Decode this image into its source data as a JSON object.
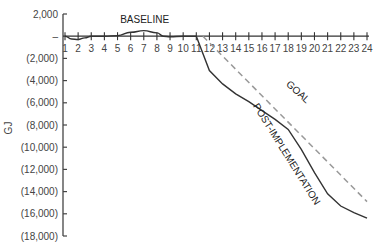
{
  "chart_data": {
    "type": "line",
    "title": "",
    "xlabel": "",
    "ylabel": "GJ",
    "x": [
      1,
      2,
      3,
      4,
      5,
      6,
      7,
      8,
      9,
      10,
      11,
      12,
      13,
      14,
      15,
      16,
      17,
      18,
      19,
      20,
      21,
      22,
      23,
      24
    ],
    "x_tick_labels": [
      "1",
      "2",
      "3",
      "4",
      "5",
      "6",
      "7",
      "8",
      "9",
      "10",
      "11",
      "12",
      "13",
      "14",
      "15",
      "16",
      "17",
      "18",
      "19",
      "20",
      "21",
      "22",
      "23",
      "24"
    ],
    "ylim": [
      -18000,
      2000
    ],
    "y_ticks": [
      2000,
      0,
      -2000,
      -4000,
      -6000,
      -8000,
      -10000,
      -12000,
      -14000,
      -16000,
      -18000
    ],
    "y_tick_labels": [
      "2,000",
      "–",
      "(2,000)",
      "(4,000)",
      "(6,000)",
      "(8,000)",
      "(10,000)",
      "(12,000)",
      "(14,000)",
      "(16,000)",
      "(18,000)"
    ],
    "grid": false,
    "legend": "none (inline annotations)",
    "series": [
      {
        "name": "BASELINE",
        "style": "solid",
        "color": "#333333",
        "x": [
          1,
          1.5,
          2,
          2.5,
          3,
          4,
          5,
          6,
          7,
          8,
          8.5,
          9,
          10,
          11
        ],
        "values": [
          0,
          -250,
          -300,
          -150,
          0,
          0,
          50,
          350,
          500,
          300,
          0,
          -50,
          0,
          0
        ]
      },
      {
        "name": "POST-IMPLEMENTATION",
        "style": "solid",
        "color": "#333333",
        "x": [
          11,
          12,
          13,
          14,
          15,
          16,
          17,
          18,
          19,
          20,
          21,
          22,
          23,
          24
        ],
        "values": [
          0,
          -3100,
          -4300,
          -5200,
          -5900,
          -6700,
          -7500,
          -8400,
          -10200,
          -12300,
          -14200,
          -15300,
          -15900,
          -16400
        ]
      },
      {
        "name": "GOAL",
        "style": "dashed",
        "color": "#999999",
        "x": [
          11.5,
          24
        ],
        "values": [
          0,
          -14900
        ]
      }
    ],
    "annotations": [
      {
        "text": "BASELINE",
        "x": 5.2,
        "y": 1200
      },
      {
        "text": "GOAL",
        "x": 17.8,
        "y": -4400,
        "rotation": 42
      },
      {
        "text": "POST-IMPLEMENTATION",
        "x": 15.3,
        "y": -6300,
        "rotation": 58
      }
    ]
  }
}
